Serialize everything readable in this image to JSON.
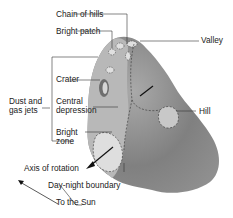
{
  "diagram": {
    "labels": {
      "chain_of_hills": "Chain of hills",
      "bright_patch": "Bright patch",
      "valley": "Valley",
      "crater": "Crater",
      "dust_and_gas_jets_line1": "Dust and",
      "dust_and_gas_jets_line2": "gas jets",
      "central_depression_line1": "Central",
      "central_depression_line2": "depression",
      "hill": "Hill",
      "bright_zone_line1": "Bright",
      "bright_zone_line2": "zone",
      "axis_of_rotation": "Axis of rotation",
      "day_night_boundary": "Day-night boundary",
      "to_the_sun": "To the Sun"
    },
    "colors": {
      "nucleus_dark": "#7a7a7a",
      "nucleus_light": "#bdbdbd",
      "bright_region": "#dcdcdc",
      "line": "#333333"
    }
  }
}
